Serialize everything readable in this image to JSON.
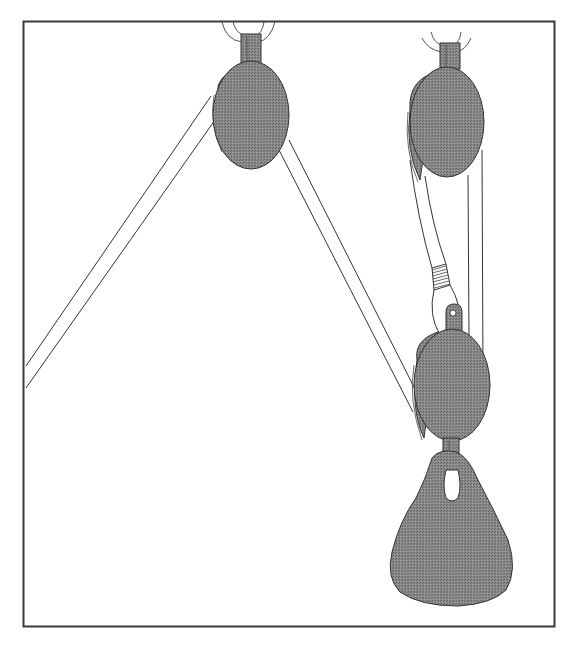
{
  "diagram": {
    "type": "pulley-system",
    "description": "Line drawing of a block-and-tackle: a rope runs from the lower left up over a fixed pulley at top center, down to a movable pulley, and a second fixed pulley at top right supports the movable pulley via a rope with a spliced eye; a pear-shaped weight hangs from the movable pulley.",
    "colors": {
      "frame": "#3a3a3a",
      "line": "#333333",
      "pulley_fill": "#7f7f7f",
      "rope_fill": "#ffffff",
      "background": "#ffffff"
    },
    "components": [
      {
        "id": "fixed-pulley-left",
        "label": "Fixed pulley (center)"
      },
      {
        "id": "fixed-pulley-right",
        "label": "Fixed pulley (right)"
      },
      {
        "id": "movable-pulley",
        "label": "Movable pulley"
      },
      {
        "id": "weight",
        "label": "Hanging weight"
      },
      {
        "id": "rope-pull",
        "label": "Pulling rope"
      },
      {
        "id": "rope-support",
        "label": "Supporting rope"
      },
      {
        "id": "eye-splice",
        "label": "Spliced eye / shackle"
      }
    ]
  }
}
